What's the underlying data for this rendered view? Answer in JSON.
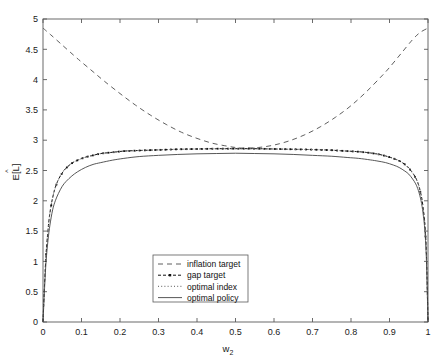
{
  "chart_data": {
    "type": "line",
    "title": "",
    "xlabel": "w_2",
    "xlabel_base": "w",
    "xlabel_sub": "2",
    "ylabel": "E[L]",
    "ylabel_hat": "^",
    "xlim": [
      0,
      1
    ],
    "ylim": [
      0,
      5
    ],
    "xticks": [
      0,
      0.1,
      0.2,
      0.3,
      0.4,
      0.5,
      0.6,
      0.7,
      0.8,
      0.9,
      1
    ],
    "xticklabels": [
      "0",
      "0.1",
      "0.2",
      "0.3",
      "0.4",
      "0.5",
      "0.6",
      "0.7",
      "0.8",
      "0.9",
      "1"
    ],
    "yticks": [
      0,
      0.5,
      1,
      1.5,
      2,
      2.5,
      3,
      3.5,
      4,
      4.5,
      5
    ],
    "yticklabels": [
      "0",
      "0.5",
      "1",
      "1.5",
      "2",
      "2.5",
      "3",
      "3.5",
      "4",
      "4.5",
      "5"
    ],
    "grid": false,
    "legend_position": "lower-center",
    "frame": "box",
    "tick_direction": "in",
    "series": [
      {
        "name": "inflation target",
        "style": "dashed",
        "color": "#4d4d4d",
        "x": [
          0,
          0.02,
          0.05,
          0.08,
          0.1,
          0.13,
          0.16,
          0.2,
          0.24,
          0.28,
          0.32,
          0.36,
          0.4,
          0.44,
          0.48,
          0.5,
          0.52,
          0.56,
          0.6,
          0.64,
          0.68,
          0.72,
          0.76,
          0.8,
          0.84,
          0.88,
          0.9,
          0.93,
          0.96,
          0.98,
          1
        ],
        "y": [
          4.85,
          4.74,
          4.57,
          4.4,
          4.29,
          4.13,
          3.97,
          3.77,
          3.58,
          3.41,
          3.26,
          3.13,
          3.03,
          2.95,
          2.9,
          2.88,
          2.87,
          2.88,
          2.92,
          2.99,
          3.09,
          3.22,
          3.38,
          3.57,
          3.8,
          4.06,
          4.2,
          4.43,
          4.66,
          4.78,
          4.85
        ]
      },
      {
        "name": "gap target",
        "style": "dashdot-marker",
        "color": "#111111",
        "x": [
          0,
          0.004,
          0.008,
          0.013,
          0.018,
          0.025,
          0.032,
          0.04,
          0.05,
          0.06,
          0.075,
          0.09,
          0.11,
          0.13,
          0.15,
          0.18,
          0.21,
          0.25,
          0.3,
          0.35,
          0.4,
          0.45,
          0.5,
          0.55,
          0.6,
          0.65,
          0.7,
          0.75,
          0.79,
          0.82,
          0.85,
          0.87,
          0.89,
          0.91,
          0.925,
          0.94,
          0.95,
          0.96,
          0.968,
          0.975,
          0.982,
          0.987,
          0.992,
          0.996,
          1
        ],
        "y": [
          0.0,
          0.62,
          1.12,
          1.52,
          1.8,
          2.05,
          2.22,
          2.35,
          2.46,
          2.54,
          2.62,
          2.67,
          2.72,
          2.75,
          2.78,
          2.8,
          2.82,
          2.83,
          2.84,
          2.85,
          2.855,
          2.86,
          2.86,
          2.86,
          2.855,
          2.85,
          2.845,
          2.835,
          2.82,
          2.81,
          2.79,
          2.77,
          2.74,
          2.7,
          2.66,
          2.6,
          2.54,
          2.46,
          2.38,
          2.27,
          2.1,
          1.9,
          1.6,
          1.1,
          0.0
        ]
      },
      {
        "name": "optimal index",
        "style": "dotted",
        "color": "#777777",
        "x": [
          0,
          0.004,
          0.008,
          0.013,
          0.018,
          0.025,
          0.032,
          0.04,
          0.05,
          0.06,
          0.075,
          0.09,
          0.11,
          0.13,
          0.15,
          0.18,
          0.21,
          0.25,
          0.3,
          0.35,
          0.4,
          0.45,
          0.5,
          0.55,
          0.6,
          0.65,
          0.7,
          0.75,
          0.79,
          0.82,
          0.85,
          0.87,
          0.89,
          0.91,
          0.925,
          0.94,
          0.95,
          0.96,
          0.968,
          0.975,
          0.982,
          0.987,
          0.992,
          0.996,
          1
        ],
        "y": [
          0.0,
          0.62,
          1.12,
          1.52,
          1.8,
          2.05,
          2.22,
          2.35,
          2.46,
          2.54,
          2.62,
          2.67,
          2.72,
          2.75,
          2.78,
          2.8,
          2.82,
          2.83,
          2.84,
          2.85,
          2.855,
          2.86,
          2.86,
          2.86,
          2.855,
          2.85,
          2.845,
          2.835,
          2.82,
          2.81,
          2.79,
          2.77,
          2.74,
          2.7,
          2.66,
          2.6,
          2.54,
          2.46,
          2.38,
          2.27,
          2.1,
          1.9,
          1.6,
          1.1,
          0.0
        ]
      },
      {
        "name": "optimal policy",
        "style": "solid",
        "color": "#444444",
        "x": [
          0,
          0.004,
          0.008,
          0.013,
          0.018,
          0.025,
          0.032,
          0.04,
          0.05,
          0.06,
          0.075,
          0.09,
          0.11,
          0.13,
          0.15,
          0.18,
          0.21,
          0.25,
          0.3,
          0.35,
          0.4,
          0.45,
          0.5,
          0.55,
          0.6,
          0.65,
          0.7,
          0.75,
          0.79,
          0.82,
          0.85,
          0.87,
          0.89,
          0.91,
          0.925,
          0.94,
          0.95,
          0.96,
          0.968,
          0.975,
          0.982,
          0.987,
          0.992,
          0.996,
          1
        ],
        "y": [
          0.0,
          0.55,
          1.0,
          1.35,
          1.6,
          1.85,
          2.0,
          2.12,
          2.24,
          2.32,
          2.41,
          2.48,
          2.55,
          2.6,
          2.63,
          2.67,
          2.7,
          2.73,
          2.75,
          2.765,
          2.775,
          2.78,
          2.785,
          2.78,
          2.775,
          2.765,
          2.75,
          2.735,
          2.715,
          2.7,
          2.675,
          2.655,
          2.63,
          2.59,
          2.55,
          2.49,
          2.44,
          2.36,
          2.28,
          2.17,
          2.0,
          1.8,
          1.5,
          1.0,
          0.0
        ]
      }
    ]
  },
  "legend": {
    "items": [
      {
        "label": "inflation target",
        "style": "dashed"
      },
      {
        "label": "gap target",
        "style": "dashdot-marker"
      },
      {
        "label": "optimal index",
        "style": "dotted"
      },
      {
        "label": "optimal policy",
        "style": "solid"
      }
    ]
  }
}
